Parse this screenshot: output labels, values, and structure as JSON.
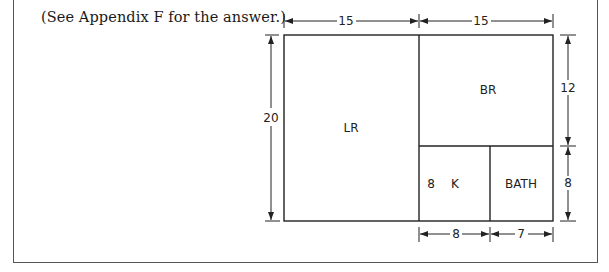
{
  "note": "(See Appendix F for the answer.)",
  "floor_plan": {
    "rooms": [
      {
        "name": "LR",
        "label": "LR"
      },
      {
        "name": "BR",
        "label": "BR"
      },
      {
        "name": "K",
        "label": "K"
      },
      {
        "name": "BATH",
        "label": "BATH"
      }
    ],
    "dimensions": {
      "top_left_width": "15",
      "top_right_width": "15",
      "left_height": "20",
      "right_upper_height": "12",
      "right_lower_height": "8",
      "bottom_kitchen_width": "8",
      "bottom_bath_width": "7",
      "kitchen_inner_height": "8"
    }
  },
  "colors": {
    "line": "#222222",
    "frame": "#555555",
    "background": "#ffffff"
  }
}
